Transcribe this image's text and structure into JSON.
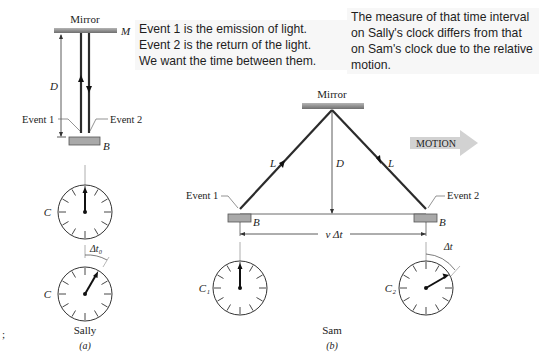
{
  "notes": {
    "note1": {
      "lines": [
        "Event 1 is the emission of light.",
        "Event 2 is the return of the light.",
        "We want the time between them."
      ]
    },
    "note2": {
      "lines": [
        "The measure of that time interval",
        "on Sally's clock differs from that",
        "on Sam's clock due to the relative",
        "motion."
      ]
    }
  },
  "panel_a": {
    "mirror_label": "Mirror",
    "mirror_symbol": "M",
    "distance_label": "D",
    "event1_label": "Event 1",
    "event2_label": "Event 2",
    "box_symbol": "B",
    "clock_top_label": "C",
    "clock_bottom_label": "C",
    "interval_label": "Δt₀",
    "observer": "Sally",
    "caption": "(a)"
  },
  "panel_b": {
    "mirror_label": "Mirror",
    "path_label_left": "L",
    "path_label_right": "L",
    "distance_label": "D",
    "motion_label": "MOTION",
    "event1_label": "Event 1",
    "event2_label": "Event 2",
    "box_symbol_left": "B",
    "box_symbol_right": "B",
    "displacement_label": "v Δt",
    "clock_left_label": "C₁",
    "clock_right_label": "C₂",
    "interval_label": "Δt",
    "observer": "Sam",
    "caption": "(b)"
  },
  "margin_mark": ";",
  "colors": {
    "mirror": "#8a8a8a",
    "box": "#a9a9a9",
    "light_path": "#2b2b2b",
    "motion_arrow": "#cfcfcf",
    "note_bg": "#f7f7f7"
  }
}
